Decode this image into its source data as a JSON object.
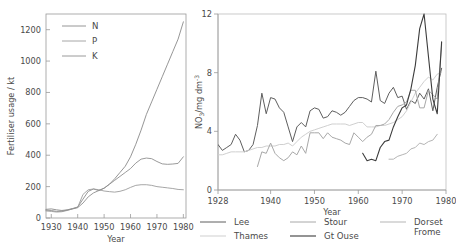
{
  "figure": {
    "panels": [
      "fertiliser-usage",
      "nitrate-concentration"
    ]
  },
  "chart_data": [
    {
      "id": "fertiliser-usage",
      "type": "line",
      "title": "",
      "xlabel": "Year",
      "ylabel": "Fertiliser usage / kt",
      "xlim": [
        1928,
        1981
      ],
      "ylim": [
        0,
        1300
      ],
      "xticks": [
        1930,
        1940,
        1950,
        1960,
        1970,
        1980
      ],
      "xtick_labels": [
        "1930",
        "1940",
        "1950",
        "1960",
        "1970",
        "1980"
      ],
      "yticks": [
        0,
        200,
        400,
        600,
        800,
        1000,
        1200
      ],
      "ytick_labels": [
        "0",
        "200",
        "400",
        "600",
        "800",
        "1000",
        "1200"
      ],
      "grid": false,
      "legend_position": "top-left",
      "legend": [
        "N",
        "P",
        "K"
      ],
      "series": [
        {
          "name": "N",
          "color": "#8a8a8a",
          "width": 0.9,
          "x": [
            1928,
            1930,
            1932,
            1934,
            1936,
            1938,
            1940,
            1942,
            1944,
            1946,
            1948,
            1950,
            1952,
            1954,
            1956,
            1958,
            1960,
            1962,
            1964,
            1966,
            1968,
            1970,
            1972,
            1974,
            1976,
            1978,
            1980
          ],
          "y": [
            55,
            58,
            52,
            48,
            52,
            60,
            70,
            120,
            170,
            185,
            175,
            190,
            215,
            250,
            290,
            330,
            390,
            470,
            560,
            660,
            740,
            820,
            900,
            980,
            1060,
            1140,
            1250
          ]
        },
        {
          "name": "P",
          "color": "#9c9c9c",
          "width": 0.9,
          "x": [
            1928,
            1930,
            1932,
            1934,
            1936,
            1938,
            1940,
            1942,
            1944,
            1946,
            1948,
            1950,
            1952,
            1954,
            1956,
            1958,
            1960,
            1962,
            1964,
            1966,
            1968,
            1970,
            1972,
            1974,
            1976,
            1978,
            1980
          ],
          "y": [
            45,
            42,
            38,
            40,
            48,
            58,
            68,
            150,
            180,
            185,
            180,
            172,
            168,
            165,
            170,
            180,
            195,
            208,
            212,
            212,
            208,
            200,
            196,
            192,
            188,
            182,
            180
          ]
        },
        {
          "name": "K",
          "color": "#8f8f8f",
          "width": 0.9,
          "x": [
            1928,
            1930,
            1932,
            1934,
            1936,
            1938,
            1940,
            1942,
            1944,
            1946,
            1948,
            1950,
            1952,
            1954,
            1956,
            1958,
            1960,
            1962,
            1964,
            1966,
            1968,
            1970,
            1972,
            1974,
            1976,
            1978,
            1980
          ],
          "y": [
            50,
            48,
            42,
            44,
            50,
            58,
            66,
            95,
            135,
            160,
            175,
            190,
            215,
            240,
            265,
            290,
            315,
            350,
            375,
            382,
            378,
            360,
            345,
            342,
            344,
            348,
            390
          ]
        }
      ]
    },
    {
      "id": "nitrate-concentration",
      "type": "line",
      "title": "",
      "xlabel": "Year",
      "ylabel": "NO₃/mg dm⁻³",
      "xlim": [
        1928,
        1980
      ],
      "ylim": [
        0,
        12
      ],
      "xticks": [
        1928,
        1940,
        1950,
        1960,
        1970,
        1980
      ],
      "xtick_labels": [
        "1928",
        "1940",
        "1950",
        "1960",
        "1970",
        "1980"
      ],
      "yticks": [
        0,
        4,
        8,
        12
      ],
      "ytick_labels": [
        "0",
        "4",
        "8",
        "12"
      ],
      "grid": false,
      "legend_position": "below",
      "legend": [
        "Lee",
        "Thames",
        "Stour",
        "Gt Ouse",
        "Dorset Frome"
      ],
      "series": [
        {
          "name": "Lee",
          "color": "#5e5e5e",
          "width": 1.0,
          "x": [
            1928,
            1929,
            1930,
            1931,
            1932,
            1933,
            1934,
            1935,
            1936,
            1937,
            1938,
            1939,
            1940,
            1941,
            1942,
            1943,
            1944,
            1945,
            1946,
            1947,
            1948,
            1949,
            1950,
            1951,
            1952,
            1953,
            1954,
            1955,
            1956,
            1957,
            1958,
            1959,
            1960,
            1961,
            1962,
            1963,
            1964,
            1965,
            1966,
            1967,
            1968,
            1969,
            1970,
            1971,
            1972,
            1973,
            1974,
            1975,
            1976,
            1977,
            1978,
            1979
          ],
          "y": [
            3.1,
            2.7,
            2.9,
            3.1,
            3.8,
            3.4,
            2.6,
            2.7,
            3.1,
            4.4,
            6.6,
            5.2,
            6.3,
            6.2,
            5.6,
            5.3,
            4.3,
            3.3,
            4.3,
            4.6,
            4.3,
            5.4,
            5.6,
            5.5,
            4.9,
            5.0,
            5.4,
            5.3,
            5.1,
            5.3,
            5.7,
            6.1,
            6.3,
            6.3,
            6.2,
            6.0,
            8.1,
            6.1,
            5.9,
            6.6,
            7.0,
            6.3,
            6.4,
            5.5,
            6.1,
            5.9,
            6.6,
            6.2,
            6.9,
            5.4,
            7.0,
            8.3
          ]
        },
        {
          "name": "Thames",
          "color": "#cfcfcf",
          "width": 1.0,
          "x": [
            1928,
            1929,
            1930,
            1931,
            1932,
            1933,
            1934,
            1935,
            1936,
            1937,
            1938,
            1939,
            1940,
            1941,
            1942,
            1943,
            1944,
            1945,
            1946,
            1947,
            1948,
            1949,
            1950,
            1951,
            1952,
            1953,
            1954,
            1955,
            1956,
            1957,
            1958,
            1959,
            1960,
            1961,
            1962,
            1963,
            1964,
            1965,
            1966,
            1967,
            1968,
            1969,
            1970,
            1971,
            1972,
            1973,
            1974,
            1975,
            1976,
            1977,
            1978,
            1979
          ],
          "y": [
            2.4,
            2.4,
            2.5,
            2.6,
            2.6,
            2.6,
            2.6,
            2.7,
            2.8,
            2.9,
            2.9,
            3.0,
            3.0,
            3.0,
            3.1,
            3.1,
            3.2,
            3.0,
            3.3,
            3.6,
            3.8,
            4.0,
            4.1,
            4.2,
            4.3,
            4.4,
            4.5,
            4.5,
            4.5,
            4.5,
            4.4,
            4.5,
            4.6,
            4.6,
            4.3,
            4.3,
            4.3,
            4.4,
            4.4,
            4.5,
            4.6,
            4.8,
            5.0,
            5.4,
            6.0,
            6.6,
            7.0,
            7.4,
            7.7,
            7.5,
            7.9,
            8.0
          ]
        },
        {
          "name": "Stour",
          "color": "#a8a8a8",
          "width": 1.0,
          "x": [
            1937,
            1938,
            1939,
            1940,
            1941,
            1942,
            1943,
            1944,
            1945,
            1946,
            1947,
            1948,
            1949,
            1950,
            1951,
            1952,
            1953,
            1954,
            1955,
            1956,
            1957,
            1958,
            1959,
            1960,
            1961,
            1962,
            1963,
            1964,
            1965,
            1966,
            1967,
            1968,
            1969,
            1970,
            1971,
            1972,
            1973,
            1974,
            1975,
            1976,
            1977,
            1978,
            1979
          ],
          "y": [
            1.6,
            2.6,
            2.5,
            3.2,
            2.5,
            2.2,
            2.0,
            2.2,
            2.6,
            2.4,
            3.0,
            2.5,
            3.9,
            3.9,
            3.9,
            3.5,
            3.9,
            3.6,
            3.5,
            3.4,
            3.2,
            3.1,
            3.9,
            3.6,
            3.3,
            3.6,
            3.8,
            4.4,
            4.4,
            4.5,
            4.8,
            5.3,
            5.7,
            5.8,
            6.0,
            6.8,
            6.8,
            5.6,
            5.6,
            6.8,
            6.5,
            6.2,
            9.9
          ]
        },
        {
          "name": "Gt Ouse",
          "color": "#3c3c3c",
          "width": 1.1,
          "x": [
            1961,
            1962,
            1963,
            1964,
            1965,
            1966,
            1967,
            1968,
            1969,
            1970,
            1971,
            1972,
            1973,
            1974,
            1975,
            1976,
            1977,
            1978,
            1979
          ],
          "y": [
            2.5,
            2.0,
            2.1,
            2.0,
            2.9,
            3.3,
            3.4,
            4.3,
            5.0,
            5.6,
            5.8,
            6.9,
            8.5,
            11.0,
            12.0,
            9.1,
            6.2,
            5.2,
            10.1
          ]
        },
        {
          "name": "Dorset Frome",
          "color": "#b5b5b5",
          "width": 1.0,
          "x": [
            1967,
            1968,
            1969,
            1970,
            1971,
            1972,
            1973,
            1974,
            1975,
            1976,
            1977,
            1978
          ],
          "y": [
            2.1,
            2.1,
            2.3,
            2.4,
            2.5,
            2.8,
            2.9,
            3.2,
            3.1,
            3.3,
            3.4,
            3.8
          ]
        }
      ]
    }
  ]
}
